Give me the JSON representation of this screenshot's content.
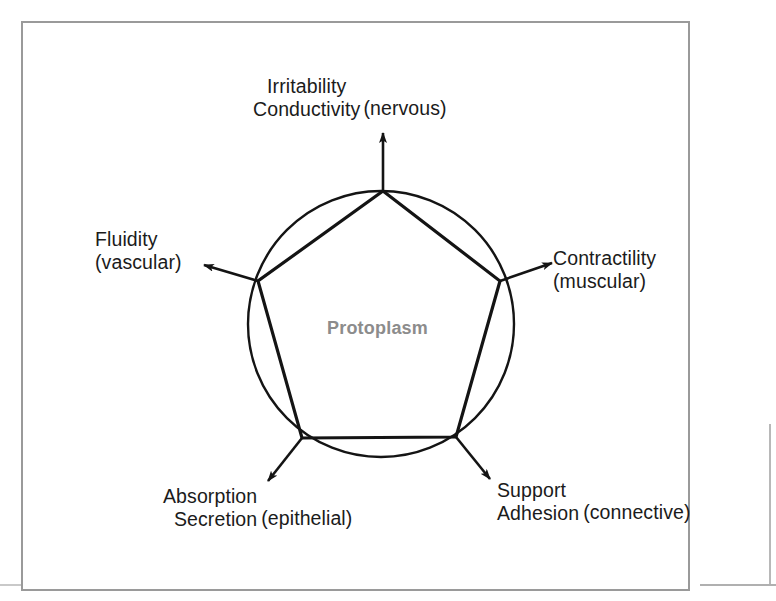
{
  "figure": {
    "center_label": "Protoplasm",
    "shape": {
      "circle": {
        "cx": 381,
        "cy": 324,
        "r": 133
      },
      "polygon": "pentagon",
      "vertices": [
        {
          "name": "top",
          "x": 383,
          "y": 191
        },
        {
          "name": "right",
          "x": 500,
          "y": 281
        },
        {
          "name": "bottom-right",
          "x": 456,
          "y": 437
        },
        {
          "name": "bottom-left",
          "x": 302,
          "y": 438
        },
        {
          "name": "left",
          "x": 258,
          "y": 281
        }
      ]
    },
    "nodes": [
      {
        "id": "nervous",
        "line1": "Irritability",
        "line2": "Conductivity",
        "tissue": "(nervous)",
        "align": "center",
        "arrow_from": {
          "x": 383,
          "y": 191
        },
        "arrow_to": {
          "x": 383,
          "y": 131
        }
      },
      {
        "id": "vascular",
        "line1": "Fluidity",
        "line2": "(vascular)",
        "tissue": "",
        "align": "left",
        "arrow_from": {
          "x": 258,
          "y": 281
        },
        "arrow_to": {
          "x": 200,
          "y": 264
        }
      },
      {
        "id": "muscular",
        "line1": "Contractility",
        "line2": "(muscular)",
        "tissue": "",
        "align": "left",
        "arrow_from": {
          "x": 500,
          "y": 281
        },
        "arrow_to": {
          "x": 556,
          "y": 262
        }
      },
      {
        "id": "epithelial",
        "line1": "Absorption",
        "line2": "Secretion",
        "tissue": "(epithelial)",
        "align": "right",
        "arrow_from": {
          "x": 302,
          "y": 438
        },
        "arrow_to": {
          "x": 264,
          "y": 486
        }
      },
      {
        "id": "connective",
        "line1": "Support",
        "line2": "Adhesion",
        "tissue": "(connective)",
        "align": "left",
        "arrow_from": {
          "x": 456,
          "y": 437
        },
        "arrow_to": {
          "x": 494,
          "y": 484
        }
      }
    ],
    "colors": {
      "ink": "#1b1b1b",
      "center_label": "#8c8c8c",
      "frame": "#9a9a9a",
      "background": "#ffffff"
    }
  }
}
